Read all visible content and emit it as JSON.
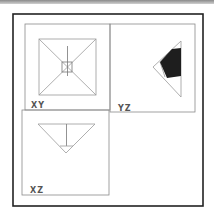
{
  "figure": {
    "panels": [
      {
        "id": "xy",
        "label": "XY"
      },
      {
        "id": "yz",
        "label": "YZ"
      },
      {
        "id": "xz",
        "label": "XZ"
      }
    ]
  },
  "colors": {
    "frame": "#222222",
    "panel_border": "#8a8a8a",
    "line": "#9a9a9a",
    "fill_dark": "#1e1e1e"
  }
}
